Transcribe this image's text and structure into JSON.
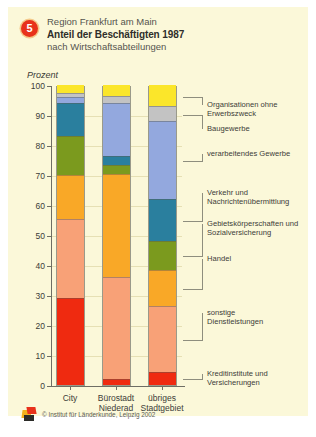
{
  "header": {
    "badge": "5",
    "line1": "Region Frankfurt am Main",
    "line2": "Anteil der Beschäftigten 1987",
    "line3": "nach Wirtschaftsabteilungen"
  },
  "axis_unit": "Prozent",
  "footer": {
    "copyright": "© Institut für Länderkunde, Leipzig 2002",
    "logo_icon": "ifl-logo-icon"
  },
  "colors": {
    "panel_background": "#fbf8d9",
    "page_background": "#ffffff",
    "badge": "#e8321b",
    "axis": "#6e6e64",
    "gridline": "#e6e0b4",
    "text": "#3c3c38"
  },
  "chart_data": {
    "type": "bar",
    "stacked": true,
    "normalized_percent": true,
    "title": "Anteil der Beschäftigten 1987",
    "subtitle": "nach Wirtschaftsabteilungen",
    "supertitle": "Region Frankfurt am Main",
    "xlabel": "",
    "ylabel": "Prozent",
    "ylim": [
      0,
      100
    ],
    "yticks": [
      0,
      10,
      20,
      30,
      40,
      50,
      60,
      70,
      80,
      90,
      100
    ],
    "grid": true,
    "legend_position": "right",
    "categories": [
      "City",
      "Bürostadt\nNiederad",
      "übriges\nStadtgebiet"
    ],
    "category_labels": [
      {
        "line1": "City",
        "line2": ""
      },
      {
        "line1": "Bürostadt",
        "line2": "Niederad"
      },
      {
        "line1": "übriges",
        "line2": "Stadtgebiet"
      }
    ],
    "series": [
      {
        "name": "Kreditinstitute und Versicherungen",
        "label_line1": "Kreditinstitute und",
        "label_line2": "Versicherungen",
        "color": "#ef2a10",
        "values": [
          29.0,
          2.0,
          4.5
        ]
      },
      {
        "name": "sonstige Dienstleistungen",
        "label_line1": "sonstige",
        "label_line2": "Dienstleistungen",
        "color": "#f8a177",
        "values": [
          26.5,
          34.0,
          22.0
        ]
      },
      {
        "name": "Handel",
        "label_line1": "Handel",
        "label_line2": "",
        "color": "#f9a827",
        "values": [
          14.5,
          34.5,
          12.0
        ]
      },
      {
        "name": "Gebietskörperschaften und Sozialversicherung",
        "label_line1": "Gebietskörperschaften und",
        "label_line2": "Sozialversicherung",
        "color": "#7b9a1e",
        "values": [
          13.0,
          3.0,
          9.5
        ]
      },
      {
        "name": "Verkehr und Nachrichtenübermittlung",
        "label_line1": "Verkehr und",
        "label_line2": "Nachrichtenübermittlung",
        "color": "#2a7f9e",
        "values": [
          11.0,
          3.0,
          14.0
        ]
      },
      {
        "name": "verarbeitendes Gewerbe",
        "label_line1": "verarbeitendes Gewerbe",
        "label_line2": "",
        "color": "#93a8de",
        "values": [
          2.0,
          17.5,
          26.0
        ]
      },
      {
        "name": "Baugewerbe",
        "label_line1": "Baugewerbe",
        "label_line2": "",
        "color": "#c3c3c3",
        "values": [
          1.5,
          2.5,
          5.0
        ]
      },
      {
        "name": "Organisationen ohne Erwerbszweck",
        "label_line1": "Organisationen ohne",
        "label_line2": "Erwerbszweck",
        "color": "#fbe62a",
        "values": [
          2.5,
          3.5,
          7.0
        ]
      }
    ]
  }
}
